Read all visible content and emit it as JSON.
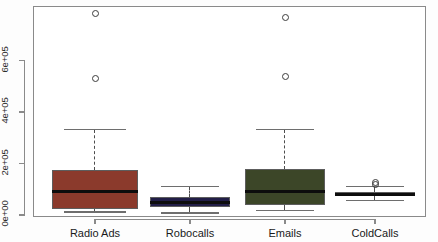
{
  "chart_data": {
    "type": "box",
    "title": "",
    "xlabel": "",
    "ylabel": "",
    "grid": false,
    "legend": "none",
    "ylim": [
      0,
      812000
    ],
    "ytick_values": [
      0,
      200000,
      400000,
      600000
    ],
    "ytick_labels": [
      "0e+00",
      "2e+05",
      "4e+05",
      "6e+05"
    ],
    "categories": [
      "Radio Ads",
      "Robocalls",
      "Emails",
      "ColdCalls"
    ],
    "box_colors": [
      "#8B3A2C",
      "#221E47",
      "#3C4628",
      "#2B1F1C"
    ],
    "boxes": [
      {
        "label": "Radio Ads",
        "color": "#8B3A2C",
        "whisker_low": 12000,
        "q1": 22000,
        "median": 92000,
        "q3": 176000,
        "whisker_high": 332000,
        "outliers": [
          532000,
          782000
        ]
      },
      {
        "label": "Robocalls",
        "color": "#221E47",
        "whisker_low": 8000,
        "q1": 32000,
        "median": 50000,
        "q3": 70000,
        "whisker_high": 110000,
        "outliers": []
      },
      {
        "label": "Emails",
        "color": "#3C4628",
        "whisker_low": 18000,
        "q1": 37000,
        "median": 92000,
        "q3": 180000,
        "whisker_high": 332000,
        "outliers": [
          540000,
          768000
        ]
      },
      {
        "label": "ColdCalls",
        "color": "#2B1F1C",
        "whisker_low": 56000,
        "q1": 72000,
        "median": 80000,
        "q3": 90000,
        "whisker_high": 110000,
        "outliers": [
          118000,
          128000
        ]
      }
    ]
  },
  "axes": {
    "y_tick_labels": [
      "0e+00",
      "2e+05",
      "4e+05",
      "6e+05"
    ],
    "x_tick_labels": [
      "Radio Ads",
      "Robocalls",
      "Emails",
      "ColdCalls"
    ]
  },
  "geometry": {
    "frame": {
      "left": 33,
      "top": 6,
      "right": 424,
      "bottom": 215
    },
    "y_axis_x": 33,
    "value_at_top": 812000,
    "value_at_bottom": 0,
    "box_centers_x": [
      95,
      190,
      285,
      375
    ],
    "box_half_width": [
      43,
      40,
      40,
      40
    ]
  }
}
